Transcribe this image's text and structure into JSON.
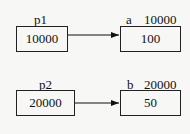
{
  "pointers": [
    {
      "name": "p1",
      "value": "10000"
    },
    {
      "name": "p2",
      "value": "20000"
    }
  ],
  "targets": [
    {
      "name": "a",
      "address": "10000",
      "value": "100"
    },
    {
      "name": "b",
      "address": "20000",
      "value": "50"
    }
  ]
}
